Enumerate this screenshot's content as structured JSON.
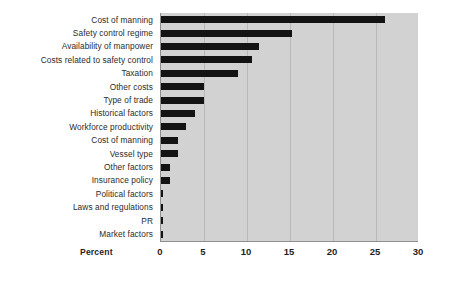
{
  "chart_data": {
    "type": "bar",
    "orientation": "horizontal",
    "title": "",
    "xlabel": "Percent",
    "ylabel": "",
    "xlim": [
      0,
      30
    ],
    "xticks": [
      0,
      5,
      10,
      15,
      20,
      25,
      30
    ],
    "xtick_labels": [
      "0",
      "5",
      "10",
      "15",
      "20",
      "25",
      "30"
    ],
    "grid": true,
    "legend": "none",
    "plot_background_color": "#d2d2d2",
    "bar_color": "#131313",
    "categories": [
      "Cost of manning",
      "Safety control regime",
      "Availability of manpower",
      "Costs related to safety control",
      "Taxation",
      "Other costs",
      "Type of trade",
      "Historical factors",
      "Workforce productivity",
      "Cost of manning",
      "Vessel type",
      "Other factors",
      "Insurance policy",
      "Political factors",
      "Laws and regulations",
      "PR",
      "Market factors"
    ],
    "values": [
      26.0,
      15.2,
      11.4,
      10.6,
      9.0,
      5.0,
      5.0,
      4.0,
      2.9,
      2.0,
      2.0,
      1.0,
      1.0,
      0.2,
      0.2,
      0.2,
      0.2
    ]
  }
}
